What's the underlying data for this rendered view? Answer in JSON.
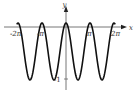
{
  "chart_data": {
    "type": "line",
    "title": "",
    "xlabel": "x",
    "ylabel": "y",
    "function_shape": "periodic wave, period π, maxima 0 at multiples of π, minima -1",
    "x_ticks": [
      {
        "value": -6.2832,
        "label": "-2π"
      },
      {
        "value": -3.1416,
        "label": "-π"
      },
      {
        "value": 3.1416,
        "label": "π"
      },
      {
        "value": 6.2832,
        "label": "2π"
      }
    ],
    "y_ticks": [
      {
        "value": -1,
        "label": "-1"
      }
    ],
    "xlim": [
      -7.2,
      8.0
    ],
    "ylim": [
      -1.25,
      0.55
    ],
    "grid": false,
    "legend": null,
    "series": [
      {
        "name": "curve",
        "color": "#111111",
        "x": [
          -6.2832,
          -4.7124,
          -3.1416,
          -1.5708,
          0,
          1.5708,
          3.1416,
          4.7124,
          6.2832
        ],
        "y": [
          0,
          -1,
          0,
          -1,
          0,
          -1,
          0,
          -1,
          0
        ]
      }
    ]
  },
  "labels": {
    "x_axis": "x",
    "y_axis": "y",
    "tick_neg2pi": "-2π",
    "tick_negpi": "-π",
    "tick_pi": "π",
    "tick_2pi": "2π",
    "tick_neg1": "-1"
  },
  "colors": {
    "axis": "#555555",
    "curve": "#111111",
    "text": "#333333"
  }
}
